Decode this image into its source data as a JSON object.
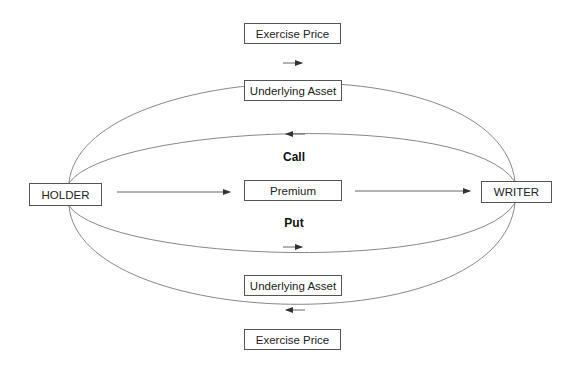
{
  "diagram": {
    "parties": {
      "holder": "HOLDER",
      "writer": "WRITER"
    },
    "center": {
      "premium": "Premium",
      "call_label": "Call",
      "put_label": "Put"
    },
    "call_flows": {
      "exercise_price": "Exercise Price",
      "underlying_asset": "Underlying Asset",
      "exercise_price_direction": "holder-to-writer",
      "underlying_asset_direction": "writer-to-holder"
    },
    "put_flows": {
      "underlying_asset": "Underlying Asset",
      "exercise_price": "Exercise Price",
      "underlying_asset_direction": "holder-to-writer",
      "exercise_price_direction": "writer-to-holder"
    },
    "premium_direction": "holder-to-writer",
    "colors": {
      "line": "#777777",
      "box_border": "#555555",
      "text": "#222222"
    }
  }
}
